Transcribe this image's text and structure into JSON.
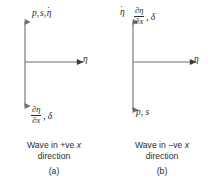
{
  "figure": {
    "type": "axis-diagram-pair",
    "background_color": "#ffffff",
    "line_color": "#6e6e6e",
    "text_color": "#2b2b2b"
  },
  "panels": [
    {
      "id": "a",
      "index_label": "(a)",
      "caption_line1_prefix": "Wave in +ve ",
      "caption_line1_var": "x",
      "caption_line2": "direction",
      "vertical_axis": {
        "style": "double-headed-arrow",
        "top_label_text": "p, s, η̇",
        "top_label_parts": [
          "p",
          "s",
          "η with overdot"
        ],
        "bottom_label_text": "∂η/∂x, δ",
        "bottom_label_numerator": "∂η",
        "bottom_label_denominator": "∂x",
        "bottom_label_tail": ", δ"
      },
      "horizontal_axis": {
        "style": "single-headed-arrow",
        "label": "η"
      }
    },
    {
      "id": "b",
      "index_label": "(b)",
      "caption_line1_prefix": "Wave in −ve ",
      "caption_line1_var": "x",
      "caption_line2": "direction",
      "vertical_axis": {
        "style": "double-headed-arrow",
        "top_label_text": "η̇",
        "top_label_secondary_numerator": "∂η",
        "top_label_secondary_denominator": "∂x",
        "top_label_secondary_tail": ", δ",
        "bottom_label_text": "p, s"
      },
      "horizontal_axis": {
        "style": "single-headed-arrow",
        "label": "η"
      }
    }
  ],
  "symbols": {
    "eta": "η",
    "delta": "δ",
    "partial": "∂",
    "comma": ","
  }
}
